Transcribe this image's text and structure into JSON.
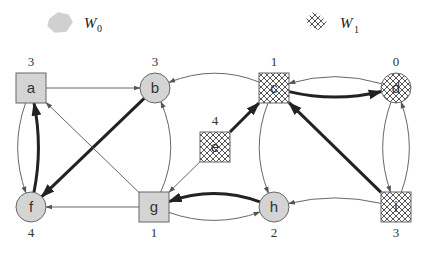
{
  "legend": [
    {
      "id": "W0",
      "label": "W",
      "sub": "0",
      "style": "gray"
    },
    {
      "id": "W1",
      "label": "W",
      "sub": "1",
      "style": "hatch"
    }
  ],
  "colors": {
    "gray_fill": "#d4d4d4",
    "stroke": "#666666",
    "edge": "#555555",
    "bold_edge": "#222222",
    "hatch_line": "#555555"
  },
  "nodes": [
    {
      "id": "a",
      "label": "a",
      "rank": "3",
      "shape": "square",
      "player": "W0"
    },
    {
      "id": "b",
      "label": "b",
      "rank": "3",
      "shape": "circle",
      "player": "W0"
    },
    {
      "id": "c",
      "label": "c",
      "rank": "1",
      "shape": "square",
      "player": "W1"
    },
    {
      "id": "d",
      "label": "d",
      "rank": "0",
      "shape": "circle",
      "player": "W1"
    },
    {
      "id": "e",
      "label": "e",
      "rank": "4",
      "shape": "square",
      "player": "W1"
    },
    {
      "id": "f",
      "label": "f",
      "rank": "4",
      "shape": "circle",
      "player": "W0"
    },
    {
      "id": "g",
      "label": "g",
      "rank": "1",
      "shape": "square",
      "player": "W0"
    },
    {
      "id": "h",
      "label": "h",
      "rank": "2",
      "shape": "circle",
      "player": "W0"
    },
    {
      "id": "i",
      "label": "i",
      "rank": "3",
      "shape": "square",
      "player": "W1"
    }
  ],
  "edges": [
    {
      "from": "a",
      "to": "b",
      "bold": false
    },
    {
      "from": "a",
      "to": "f",
      "bold": false
    },
    {
      "from": "f",
      "to": "a",
      "bold": true
    },
    {
      "from": "b",
      "to": "f",
      "bold": true
    },
    {
      "from": "g",
      "to": "a",
      "bold": false
    },
    {
      "from": "g",
      "to": "b",
      "bold": false
    },
    {
      "from": "g",
      "to": "f",
      "bold": false
    },
    {
      "from": "c",
      "to": "b",
      "bold": false
    },
    {
      "from": "e",
      "to": "c",
      "bold": true
    },
    {
      "from": "e",
      "to": "g",
      "bold": false
    },
    {
      "from": "c",
      "to": "d",
      "bold": true
    },
    {
      "from": "d",
      "to": "c",
      "bold": false
    },
    {
      "from": "c",
      "to": "h",
      "bold": false
    },
    {
      "from": "h",
      "to": "g",
      "bold": true
    },
    {
      "from": "g",
      "to": "h",
      "bold": false
    },
    {
      "from": "i",
      "to": "c",
      "bold": true
    },
    {
      "from": "d",
      "to": "i",
      "bold": false
    },
    {
      "from": "i",
      "to": "d",
      "bold": false
    },
    {
      "from": "i",
      "to": "h",
      "bold": false
    }
  ]
}
